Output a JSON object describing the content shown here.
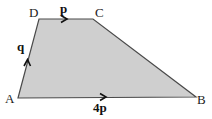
{
  "diagram": {
    "type": "trapezium",
    "fill_color": "#cfcfcf",
    "edge_color": "#4a4a4a",
    "vertices": [
      {
        "id": "A",
        "label": "A"
      },
      {
        "id": "B",
        "label": "B"
      },
      {
        "id": "C",
        "label": "C"
      },
      {
        "id": "D",
        "label": "D"
      }
    ],
    "vectors": [
      {
        "edge": "DC",
        "label": "p"
      },
      {
        "edge": "AD",
        "label": "q"
      },
      {
        "edge": "AB",
        "label": "4p"
      }
    ]
  }
}
